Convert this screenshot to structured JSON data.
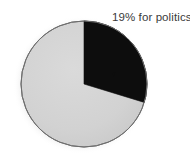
{
  "figure": {
    "background_color": "#ffffff",
    "annotation": {
      "text": "19% for politics",
      "color": "#3a3a3a"
    }
  },
  "chart_data": {
    "type": "pie",
    "title": "",
    "categories": [
      "for politics",
      "other"
    ],
    "values": [
      19,
      81
    ],
    "labels": [
      "19% for politics",
      ""
    ],
    "colors": [
      "#0d0d0d",
      "#d2d2d2"
    ],
    "units": "percent",
    "start_angle_deg": 0,
    "direction": "clockwise",
    "legend": "none",
    "grid": false,
    "annotations": [
      {
        "text": "19% for politics",
        "points_to": "for politics",
        "position": "top-right"
      }
    ],
    "geometry": {
      "center_x": 84,
      "center_y": 84,
      "radius": 63,
      "slice_sweep_deg": 107,
      "outline_color": "#6e6e6e"
    }
  }
}
